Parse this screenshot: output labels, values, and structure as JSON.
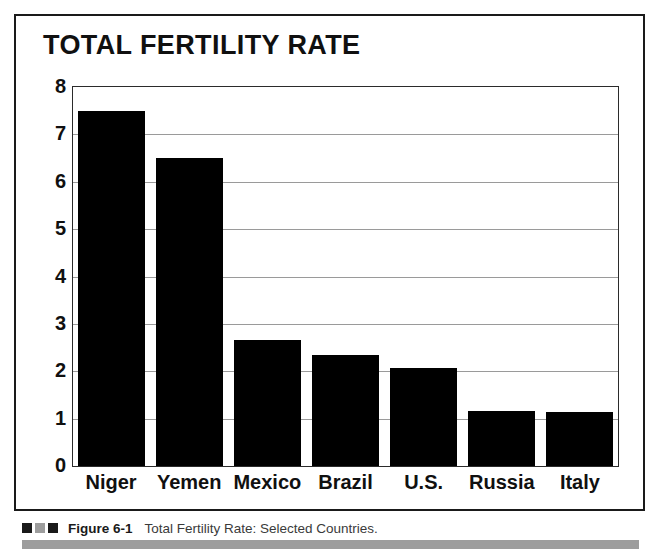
{
  "figure": {
    "title": "TOTAL FERTILITY RATE",
    "caption_number": "Figure 6-1",
    "caption_text": "Total Fertility Rate: Selected Countries.",
    "marker_icons": [
      "square-dark-icon",
      "square-gray-icon",
      "square-dark-icon"
    ]
  },
  "colors": {
    "bar": "#000000",
    "gridline": "#9a9a9a",
    "axis": "#2b2b2b",
    "frame": "#1a1a1a",
    "rule": "#9d9d9d",
    "title_text": "#101010",
    "caption_text": "#3a3a3a"
  },
  "chart_data": {
    "type": "bar",
    "title": "TOTAL FERTILITY RATE",
    "xlabel": "",
    "ylabel": "",
    "categories": [
      "Niger",
      "Yemen",
      "Mexico",
      "Brazil",
      "U.S.",
      "Russia",
      "Italy"
    ],
    "values": [
      7.5,
      6.5,
      2.67,
      2.35,
      2.06,
      1.16,
      1.14
    ],
    "ylim": [
      0,
      8
    ],
    "yticks": [
      0,
      1,
      2,
      3,
      4,
      5,
      6,
      7,
      8
    ],
    "ytick_labels": [
      "0",
      "1",
      "2",
      "3",
      "4",
      "5",
      "6",
      "7",
      "8"
    ],
    "grid": true,
    "grid_axis": "y",
    "legend": false,
    "bar_color": "#000000"
  }
}
